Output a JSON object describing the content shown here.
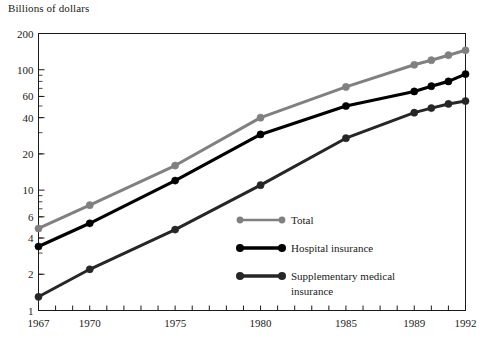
{
  "chart_data": {
    "type": "line",
    "title": "",
    "subtitle": "",
    "ylabel": "Billions of dollars",
    "xlabel": "",
    "yscale": "log",
    "ylim": [
      1,
      200
    ],
    "xlim": [
      1967,
      1992
    ],
    "grid": false,
    "legend_position": "inside-center",
    "y_ticks": [
      1,
      2,
      4,
      6,
      10,
      20,
      40,
      60,
      100,
      200
    ],
    "y_tick_labels": [
      "1",
      "2",
      "4",
      "6",
      "10",
      "20",
      "40",
      "60",
      "100",
      "200"
    ],
    "x_ticks": [
      1967,
      1970,
      1975,
      1980,
      1985,
      1989,
      1992
    ],
    "x_tick_labels": [
      "1967",
      "1970",
      "1975",
      "1980",
      "1985",
      "1989",
      "1992"
    ],
    "x": [
      1967,
      1970,
      1975,
      1980,
      1985,
      1989,
      1990,
      1991,
      1992
    ],
    "series": [
      {
        "name": "Total",
        "color": "#808080",
        "values": [
          4.8,
          7.5,
          16.0,
          40.0,
          72.0,
          110.0,
          120.0,
          132.0,
          145.0
        ]
      },
      {
        "name": "Hospital insurance",
        "color": "#000000",
        "values": [
          3.4,
          5.3,
          12.0,
          29.0,
          50.0,
          66.0,
          73.0,
          80.0,
          92.0
        ]
      },
      {
        "name": "Supplementary medical insurance",
        "color": "#262626",
        "values": [
          1.3,
          2.2,
          4.7,
          11.0,
          27.0,
          44.0,
          48.0,
          52.0,
          55.0
        ]
      }
    ]
  },
  "legend": {
    "items": [
      {
        "label": "Total"
      },
      {
        "label": "Hospital insurance"
      },
      {
        "label": "Supplementary medical"
      },
      {
        "label": "insurance"
      }
    ]
  }
}
